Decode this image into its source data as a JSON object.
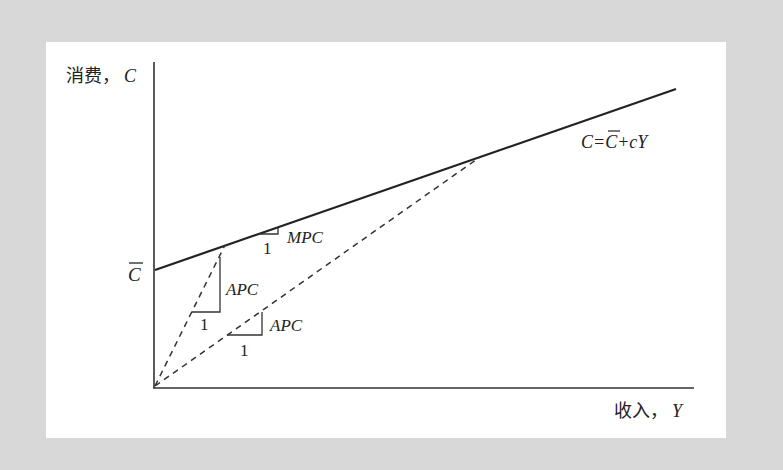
{
  "diagram": {
    "type": "consumption-function",
    "axes": {
      "y_label": "消费，",
      "y_var": "C",
      "x_label": "收入，",
      "x_var": "Y",
      "origin": [
        154,
        387
      ],
      "y_axis_top": [
        154,
        62
      ],
      "x_axis_end": [
        694,
        387
      ]
    },
    "intercept_label": "C",
    "consumption_line": {
      "start": [
        155,
        270
      ],
      "end": [
        676,
        89
      ],
      "equation_parts": {
        "lhs": "C=",
        "cbar": "C",
        "rhs": "+cY"
      }
    },
    "mpc_triangle": {
      "slope_label": "MPC",
      "run_label": "1"
    },
    "apc_triangle_1": {
      "ray_end": [
        225,
        245
      ],
      "slope_label": "APC",
      "run_label": "1"
    },
    "apc_triangle_2": {
      "ray_end": [
        480,
        157
      ],
      "slope_label": "APC",
      "run_label": "1"
    },
    "colors": {
      "background": "#d8d8d8",
      "panel": "#ffffff",
      "ink": "#222222"
    }
  }
}
